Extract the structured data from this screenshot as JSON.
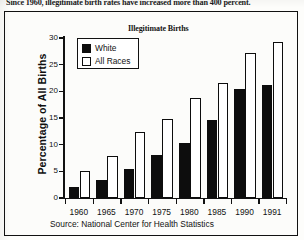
{
  "headline": "Since 1960, illegitimate birth rates have increased more than 400 percent.",
  "figure": {
    "source_note": "Source: National Center for Health Statistics"
  },
  "legend": {
    "position": "inside-top-left",
    "entries": [
      {
        "label": "White",
        "swatch": "filled-black-square"
      },
      {
        "label": "All Races",
        "swatch": "hollow-white-square"
      }
    ]
  },
  "chart_data": {
    "type": "bar",
    "title": "Illegitimate Births",
    "xlabel": "",
    "ylabel": "Percentage of All Births",
    "categories": [
      "1960",
      "1965",
      "1970",
      "1975",
      "1980",
      "1985",
      "1990",
      "1991"
    ],
    "series": [
      {
        "name": "White",
        "color": "#0d0d0d",
        "values": [
          2.0,
          3.4,
          5.5,
          8.0,
          10.3,
          14.6,
          20.4,
          21.2
        ]
      },
      {
        "name": "All Races",
        "color": "#ffffff",
        "values": [
          5.0,
          7.8,
          12.4,
          14.8,
          18.7,
          21.5,
          27.1,
          29.3
        ]
      }
    ],
    "ylim": [
      0,
      30
    ],
    "yticks": [
      0,
      5,
      10,
      15,
      20,
      25,
      30
    ],
    "grid": false,
    "legend_position": "upper-left-inside"
  }
}
